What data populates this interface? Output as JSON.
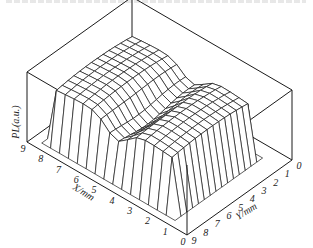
{
  "chart_data": {
    "type": "surface3d",
    "title": "",
    "zlabel": "PL(a.u.)",
    "xlabel": "X/mm",
    "ylabel": "Y/mm",
    "x_ticks": [
      "9",
      "8",
      "7",
      "6",
      "5",
      "4",
      "3",
      "2",
      "1",
      "0"
    ],
    "y_ticks": [
      "9",
      "8",
      "7",
      "6",
      "5",
      "4",
      "3",
      "2",
      "1",
      "0"
    ],
    "x_range": [
      0,
      9
    ],
    "y_range": [
      0,
      9
    ],
    "z_ticks": [],
    "style": "wireframe, black on white, bounding box",
    "surface": {
      "plateau_height": 0.85,
      "dip_center_x": 4.6,
      "dip_depth": 0.35,
      "dip_width": 0.6,
      "plateau_x": [
        1.5,
        8.0
      ],
      "plateau_y": [
        1.5,
        8.2
      ]
    }
  },
  "labels": {
    "zaxis": "PL(a.u.)",
    "xaxis": "X/mm",
    "yaxis": "Y/mm"
  }
}
